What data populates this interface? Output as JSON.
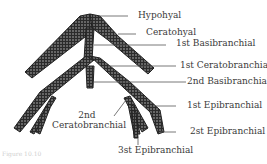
{
  "diagram": {
    "colors": {
      "bone_fill": "#2b2b2b",
      "stipple": "#bdbdbd",
      "line": "#444444",
      "text": "#3a3a3a"
    },
    "labels": {
      "hypohyal": "Hypohyal",
      "ceratohyal": "Ceratohyal",
      "basibranchial_1": "1st Basibranchial",
      "ceratobranchial_1": "1st Ceratobranchial",
      "basibranchial_2": "2nd Basibranchial",
      "epibranchial_1": "1st Epibranchial",
      "ceratobranchial_2_line1": "2nd",
      "ceratobranchial_2_line2": "Ceratobranchial",
      "epibranchial_2": "2st Epibranchial",
      "epibranchial_3": "3st Epibranchial"
    },
    "footer": "Figure 10.10"
  }
}
